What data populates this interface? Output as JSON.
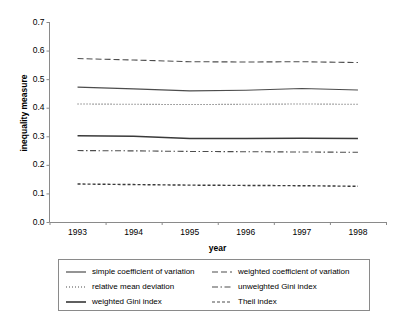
{
  "chart_data": {
    "type": "line",
    "title": "",
    "xlabel": "year",
    "ylabel": "inequality measure",
    "categories": [
      "1993",
      "1994",
      "1995",
      "1996",
      "1997",
      "1998"
    ],
    "x": [
      1993,
      1994,
      1995,
      1996,
      1997,
      1998
    ],
    "xlim": [
      1992.5,
      1998.5
    ],
    "ylim": [
      0.0,
      0.7
    ],
    "yticks": [
      "0.0",
      "0.1",
      "0.2",
      "0.3",
      "0.4",
      "0.5",
      "0.6",
      "0.7"
    ],
    "ytick_values": [
      0.0,
      0.1,
      0.2,
      0.3,
      0.4,
      0.5,
      0.6,
      0.7
    ],
    "grid": false,
    "legend_position": "below",
    "series": [
      {
        "name": "simple coefficient of variation",
        "style": "solid",
        "width": 1.1,
        "color": "#4d4d4d",
        "values": [
          0.472,
          0.466,
          0.459,
          0.461,
          0.467,
          0.462
        ]
      },
      {
        "name": "weighted coefficient of variation",
        "style": "dashed",
        "width": 1.1,
        "color": "#4d4d4d",
        "values": [
          0.572,
          0.567,
          0.561,
          0.56,
          0.561,
          0.558
        ]
      },
      {
        "name": "relative mean deviation",
        "style": "dotted",
        "width": 1.1,
        "color": "#4d4d4d",
        "values": [
          0.413,
          0.412,
          0.411,
          0.412,
          0.413,
          0.412
        ]
      },
      {
        "name": "unweighted Gini index",
        "style": "dashdot",
        "width": 1.1,
        "color": "#4d4d4d",
        "values": [
          0.25,
          0.249,
          0.247,
          0.246,
          0.245,
          0.244
        ]
      },
      {
        "name": "weighted Gini index",
        "style": "solid",
        "width": 1.6,
        "color": "#3a3a3a",
        "values": [
          0.302,
          0.3,
          0.292,
          0.292,
          0.293,
          0.292
        ]
      },
      {
        "name": "Theil index",
        "style": "shortdash",
        "width": 1.4,
        "color": "#3a3a3a",
        "values": [
          0.133,
          0.131,
          0.129,
          0.128,
          0.127,
          0.125
        ]
      }
    ]
  },
  "axis": {
    "ylabel": "inequality measure",
    "xlabel": "year",
    "ytick_labels": [
      "0.7",
      "0.6",
      "0.5",
      "0.4",
      "0.3",
      "0.2",
      "0.1",
      "0.0"
    ],
    "xtick_labels": [
      "1993",
      "1994",
      "1995",
      "1996",
      "1997",
      "1998"
    ]
  },
  "legend": {
    "entries": [
      {
        "label": "simple coefficient of variation",
        "style": "solid"
      },
      {
        "label": "weighted coefficient of variation",
        "style": "dashed"
      },
      {
        "label": "relative mean deviation",
        "style": "dotted"
      },
      {
        "label": "unweighted Gini index",
        "style": "dashdot"
      },
      {
        "label": "weighted Gini index",
        "style": "solid-thick"
      },
      {
        "label": "Theil index",
        "style": "shortdash"
      }
    ]
  },
  "colors": {
    "line": "#4d4d4d",
    "axis": "#8a8a8a",
    "text": "#000000",
    "background": "#ffffff"
  }
}
